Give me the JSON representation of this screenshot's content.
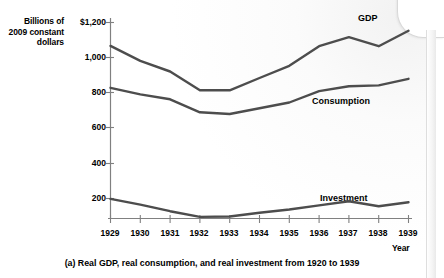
{
  "figure": {
    "caption": "(a) Real GDP, real consumption, and real investment from 1920 to 1939",
    "y_axis_title": "Billions of 2009 constant dollars",
    "x_axis_title": "Year"
  },
  "labels": {
    "gdp": "GDP",
    "consumption": "Consumption",
    "investment": "Investment"
  },
  "ticks": {
    "y": [
      "$1,200",
      "1,000",
      "800",
      "600",
      "400",
      "200"
    ],
    "x": [
      "1929",
      "1930",
      "1931",
      "1932",
      "1933",
      "1934",
      "1935",
      "1936",
      "1937",
      "1938",
      "1939"
    ]
  },
  "chart_data": {
    "type": "line",
    "title": "(a) Real GDP, real consumption, and real investment from 1920 to 1939",
    "xlabel": "Year",
    "ylabel": "Billions of 2009 constant dollars",
    "x": [
      1929,
      1930,
      1931,
      1932,
      1933,
      1934,
      1935,
      1936,
      1937,
      1938,
      1939
    ],
    "xlim": [
      1929,
      1939
    ],
    "ylim": [
      0,
      1200
    ],
    "ytick_values": [
      200,
      400,
      600,
      800,
      1000,
      1200
    ],
    "ytick_labels": [
      "200",
      "400",
      "600",
      "800",
      "1,000",
      "$1,200"
    ],
    "grid": false,
    "legend": "inline-end-labels",
    "series": [
      {
        "name": "GDP",
        "color": "#4d4d4d",
        "values": [
          1057,
          965,
          900,
          785,
          785,
          860,
          935,
          1055,
          1110,
          1055,
          1150
        ]
      },
      {
        "name": "Consumption",
        "color": "#4d4d4d",
        "values": [
          800,
          760,
          730,
          650,
          640,
          675,
          710,
          780,
          810,
          815,
          855
        ]
      },
      {
        "name": "Investment",
        "color": "#4d4d4d",
        "values": [
          120,
          85,
          45,
          10,
          12,
          35,
          55,
          80,
          105,
          75,
          100
        ]
      }
    ]
  }
}
